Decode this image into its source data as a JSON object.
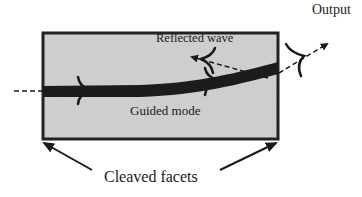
{
  "diagram": {
    "labels": {
      "output": "Output",
      "reflected_wave": "Reflected wave",
      "guided_mode": "Guided mode",
      "cleaved_facets": "Cleaved facets"
    },
    "elements": {
      "chip": {
        "shape": "rectangle",
        "fill": "#c9c9c9",
        "border": "#222222"
      },
      "waveguide": {
        "shape": "curved-band",
        "color": "#1c1c1c"
      },
      "input_beam": {
        "style": "dashed"
      },
      "reflected_beam": {
        "style": "dashed-arrow",
        "direction": "backward-left"
      },
      "output_beam": {
        "style": "dashed-arrow",
        "direction": "up-right"
      },
      "facet_pointers": {
        "count": 2,
        "targets": [
          "left-facet",
          "right-facet"
        ]
      }
    },
    "colors": {
      "ink": "#1a1a1a",
      "chip_fill": "#cdcdcd",
      "background": "#ffffff"
    }
  }
}
